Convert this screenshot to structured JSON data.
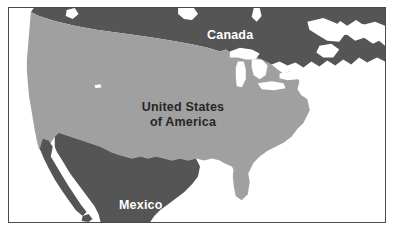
{
  "figure": {
    "kind": "reference-map",
    "width": 394,
    "height": 235
  },
  "frame": {
    "border_color": "#4a4a4a",
    "background_color": "#ffffff"
  },
  "palette": {
    "ocean": "#ffffff",
    "united_states_fill": "#a0a0a0",
    "canada_fill": "#555555",
    "mexico_fill": "#555555",
    "lakes_fill": "#ffffff",
    "label_light": "#ffffff",
    "label_dark": "#262626"
  },
  "regions": [
    {
      "id": "canada",
      "label": "Canada",
      "fill": "#555555",
      "label_color": "#ffffff",
      "label_position": "north-central"
    },
    {
      "id": "united-states",
      "label_line_1": "United States",
      "label_line_2": "of America",
      "fill": "#a0a0a0",
      "label_color": "#262626",
      "label_position": "center"
    },
    {
      "id": "mexico",
      "label": "Mexico",
      "fill": "#555555",
      "label_color": "#ffffff",
      "label_position": "south-west"
    }
  ],
  "water_features": [
    {
      "id": "great-lakes",
      "name": "Great Lakes",
      "fill": "#ffffff"
    },
    {
      "id": "gulf-of-california",
      "name": "Gulf of California",
      "fill": "#ffffff"
    },
    {
      "id": "hudson-bay-inlet",
      "name": "Hudson Bay inlet",
      "fill": "#ffffff"
    },
    {
      "id": "gulf-of-st-lawrence",
      "name": "Gulf of St. Lawrence",
      "fill": "#ffffff"
    }
  ],
  "labels": {
    "canada": "Canada",
    "usa_line_1": "United States",
    "usa_line_2": "of America",
    "mexico": "Mexico"
  }
}
